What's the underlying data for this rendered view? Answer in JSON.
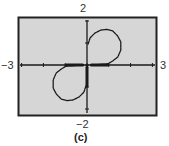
{
  "chart_data": {
    "type": "line",
    "title": "",
    "caption": "(c)",
    "xlabel": "",
    "ylabel": "",
    "xlim": [
      -3,
      3
    ],
    "ylim": [
      -2,
      2
    ],
    "x_ticks": [
      -3,
      -2,
      -1,
      0,
      1,
      2,
      3
    ],
    "y_ticks": [
      -2,
      -1,
      0,
      1,
      2
    ],
    "grid": false,
    "legend": null,
    "window_labels": {
      "xmin": "−3",
      "xmax": "3",
      "ymin": "−2",
      "ymax": "2"
    },
    "series": [
      {
        "name": "upper-lobe",
        "points": [
          [
            0.2,
            0.0
          ],
          [
            0.95,
            0.05
          ],
          [
            1.18,
            0.18
          ],
          [
            1.41,
            0.36
          ],
          [
            1.55,
            0.68
          ],
          [
            1.55,
            1.05
          ],
          [
            1.41,
            1.32
          ],
          [
            1.18,
            1.55
          ],
          [
            0.91,
            1.62
          ],
          [
            0.64,
            1.59
          ],
          [
            0.36,
            1.45
          ],
          [
            0.14,
            1.23
          ],
          [
            0.05,
            0.95
          ]
        ]
      },
      {
        "name": "lower-lobe",
        "points": [
          [
            -0.2,
            0.0
          ],
          [
            -0.95,
            -0.05
          ],
          [
            -1.18,
            -0.18
          ],
          [
            -1.41,
            -0.36
          ],
          [
            -1.55,
            -0.68
          ],
          [
            -1.55,
            -1.05
          ],
          [
            -1.41,
            -1.32
          ],
          [
            -1.18,
            -1.55
          ],
          [
            -0.91,
            -1.62
          ],
          [
            -0.64,
            -1.59
          ],
          [
            -0.36,
            -1.45
          ],
          [
            -0.14,
            -1.23
          ],
          [
            -0.05,
            -0.95
          ]
        ]
      },
      {
        "name": "axis-segment-positive-x",
        "points": [
          [
            0.2,
            0.0
          ],
          [
            0.95,
            0.0
          ]
        ]
      },
      {
        "name": "axis-segment-negative-x",
        "points": [
          [
            -0.2,
            0.0
          ],
          [
            -0.95,
            0.0
          ]
        ]
      },
      {
        "name": "axis-segment-negative-y",
        "points": [
          [
            0.0,
            -0.1
          ],
          [
            0.0,
            -0.95
          ]
        ]
      }
    ]
  },
  "colors": {
    "plot_background": "#d6d6d6",
    "frame": "#222222",
    "axes": "#1a1a1a",
    "curve": "#1a1a1a"
  }
}
